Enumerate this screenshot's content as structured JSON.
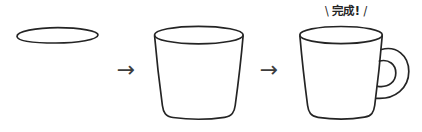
{
  "illustration": {
    "type": "step-by-step-drawing-tutorial",
    "subject": "mug",
    "colors": {
      "background": "#ffffff",
      "line": "#242424",
      "arrow": "#3d3d3d",
      "text": "#242424"
    },
    "steps": [
      {
        "icon": "oval-rim-sketch-icon"
      },
      {
        "icon": "tapered-cup-sketch-icon"
      },
      {
        "icon": "mug-with-handle-sketch-icon"
      }
    ],
    "arrow": {
      "glyph": "→"
    },
    "completion_callout": {
      "left_mark": "\\",
      "label": "完成!",
      "right_mark": "/"
    }
  }
}
